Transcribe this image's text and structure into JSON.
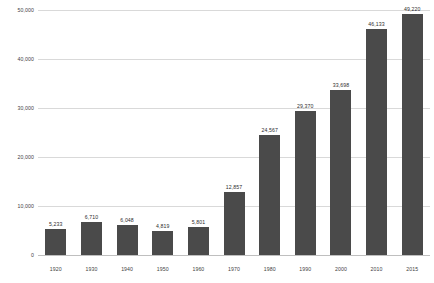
{
  "chart_data": {
    "type": "bar",
    "title": "",
    "subtitle": "",
    "xlabel": "",
    "ylabel": "",
    "ylim": [
      0,
      50000
    ],
    "grid": true,
    "legend": null,
    "bar_color": "#4a4a4a",
    "background_color": "#ffffff",
    "gridline_color": "#d9d9d9",
    "categories": [
      "1920",
      "1930",
      "1940",
      "1950",
      "1960",
      "1970",
      "1980",
      "1990",
      "2000",
      "2010",
      "2015"
    ],
    "values": [
      5233,
      6710,
      6048,
      4819,
      5801,
      12857,
      24567,
      29370,
      33698,
      46133,
      49220
    ],
    "value_labels": [
      "5,233",
      "6,710",
      "6,048",
      "4,819",
      "5,801",
      "12,857",
      "24,567",
      "29,370",
      "33,698",
      "46,133",
      "49,220"
    ],
    "y_ticks": [
      0,
      10000,
      20000,
      30000,
      40000,
      50000
    ],
    "y_tick_labels": [
      "0",
      "10,000",
      "20,000",
      "30,000",
      "40,000",
      "50,000"
    ]
  }
}
